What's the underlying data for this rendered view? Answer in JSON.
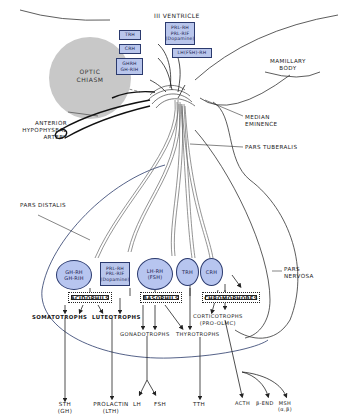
{
  "diagram": {
    "colors": {
      "hormone_fill": "#b9c6ec",
      "hormone_border": "#2b3a6e",
      "chiasm_fill": "#c8c8c8",
      "line": "#222222"
    },
    "structures": {
      "third_ventricle": "III VENTRICLE",
      "optic_chiasm": [
        "OPTIC",
        "CHIASM"
      ],
      "mamillary_body": [
        "MAMILLARY",
        "BODY"
      ],
      "anterior_hypophyseal_artery": [
        "ANTERIOR",
        "HYPOPHYSEAL",
        "ARTERY"
      ],
      "median_eminence": [
        "MEDIAN",
        "EMINENCE"
      ],
      "pars_tuberalis": "PARS TUBERALIS",
      "pars_distalis": "PARS DISTALIS",
      "pars_nervosa": [
        "PARS",
        "NERVOSA"
      ]
    },
    "hypothalamic_boxes": {
      "trh": "TRH",
      "crh": "CRH",
      "ghrh": [
        "GHRH",
        "GH-RIH"
      ],
      "prl": [
        "PRL-RH",
        "PRL-RIF",
        "(Dopamine)"
      ],
      "lh": "LH(FSH)-RH"
    },
    "portal_ellipses": {
      "gh": [
        "GH-RH",
        "GH-RIH"
      ],
      "prl": [
        "PRL-RH",
        "PRL-RIF",
        "(Dopamine)"
      ],
      "lhrh": [
        "LH-RH",
        "(FSH)"
      ],
      "trh": "TRH",
      "crh": "CRH"
    },
    "cell_groups": {
      "acidophils": "ACIDOPHILS",
      "basophils": "BASOPHILS",
      "chromophobes": "CHROMOPHOBES"
    },
    "cell_types": {
      "somatotrophs": "SOMATOTROPHS",
      "luteotrophs": "LUTEOTROPHS",
      "gonadotrophs": "GONADOTROPHS",
      "thyrotrophs": "THYROTROPHS",
      "corticotrophs": [
        "CORTICOTROPHS",
        "(PRO-OLMC)"
      ]
    },
    "hormones": {
      "sth": [
        "STH",
        "(GH)"
      ],
      "prolactin": [
        "PROLACTIN",
        "(LTH)"
      ],
      "lh": "LH",
      "fsh": "FSH",
      "tth": "TTH",
      "acth": "ACTH",
      "bend": "β-END",
      "msh": [
        "MSH",
        "(α,β)"
      ]
    }
  }
}
